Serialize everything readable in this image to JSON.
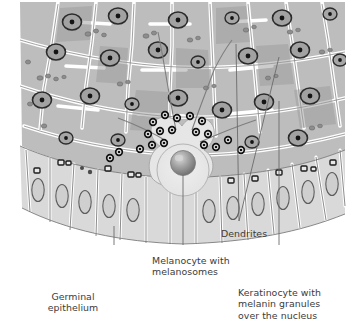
{
  "figure": {
    "type": "biological-illustration",
    "background_color": "#ffffff"
  },
  "palette": {
    "cell_fill_upper": "#b9b9b9",
    "cell_fill_mid": "#c8c8c8",
    "cell_fill_basal": "#d7d7d7",
    "melanocyte_fill": "#e4e4e4",
    "cell_border": "#ffffff",
    "outline": "#5a5a5a",
    "nucleus_ring": "#2f2f2f",
    "nucleus_fill": "#9a9a9a",
    "melanosome": "#1a1a1a",
    "granule": "#8d8d8d",
    "leader_line": "#6b6b6b",
    "text": "#3b3b3b"
  },
  "labels": [
    {
      "id": "germinal-epithelium",
      "text": "Germinal\nepithelium",
      "lines": [
        "Germinal",
        "epithelium"
      ],
      "align": "center",
      "x": 55,
      "y": 291,
      "leader": {
        "x1": 114,
        "y1": 226,
        "x2": 114,
        "y2": 286
      }
    },
    {
      "id": "melanocyte-with-melanosomes",
      "text": "Melanocyte with\nmelanosomes",
      "lines": [
        "Melanocyte with",
        "melanosomes"
      ],
      "align": "left",
      "x": 152,
      "y": 255,
      "leader": {
        "x1": 183,
        "y1": 175,
        "x2": 183,
        "y2": 251
      }
    },
    {
      "id": "dendrites",
      "text": "Dendrites",
      "lines": [
        "Dendrites"
      ],
      "align": "left",
      "x": 221,
      "y": 228,
      "leader_paths": [
        {
          "x1": 236,
          "y1": 44,
          "x2": 239,
          "y2": 221
        },
        {
          "x1": 279,
          "y1": 57,
          "x2": 239,
          "y2": 221
        }
      ]
    },
    {
      "id": "keratinocyte-with-melanin-granules",
      "text": "Keratinocyte with\nmelanin granules\nover the nucleus",
      "lines": [
        "Keratinocyte with",
        "melanin granules",
        "over the nucleus"
      ],
      "align": "left",
      "x": 238,
      "y": 287,
      "leader": {
        "x1": 279,
        "y1": 101,
        "x2": 279,
        "y2": 283
      }
    }
  ],
  "structures": {
    "germinal_epithelium": "basal columnar cell layer",
    "melanocyte": "pale cell with large shaded spherical nucleus at the basal layer",
    "melanosomes": "dark granules clustered around the melanocyte",
    "dendrites": "slender cytoplasmic processes extending between keratinocytes",
    "keratinocyte": "polygonal cells with melanin granules capping the nucleus"
  }
}
